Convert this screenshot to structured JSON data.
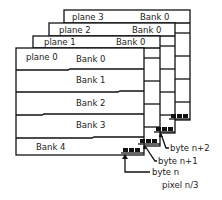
{
  "diagram": {
    "planes": [
      {
        "label": "plane 0",
        "bank_label": "Bank 0"
      },
      {
        "label": "plane 1",
        "bank_label": "Bank 0"
      },
      {
        "label": "plane 2",
        "bank_label": "Bank 0"
      },
      {
        "label": "plane 3",
        "bank_label": "Bank 0"
      }
    ],
    "banks": [
      "Bank 0",
      "Bank 1",
      "Bank 2",
      "Bank 3",
      "Bank 4"
    ],
    "annotations": {
      "byte_n2": "byte n+2",
      "byte_n1": "byte n+1",
      "byte_n": "byte n",
      "pixel": "pixel n/3"
    }
  }
}
